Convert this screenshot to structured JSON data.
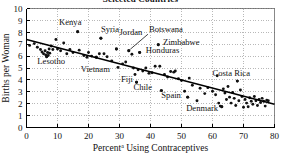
{
  "figure": {
    "title_partial": "Selected Countries",
    "title_clipped": true
  },
  "chart_data": {
    "type": "scatter",
    "title": "Selected Countries",
    "xlabel": "Percent Using Contraceptives",
    "xlabel_superscript": "a",
    "ylabel": "Births per Woman",
    "xlim": [
      0,
      80
    ],
    "ylim": [
      0,
      10
    ],
    "xticks": [
      0,
      10,
      20,
      30,
      40,
      50,
      60,
      70,
      80
    ],
    "yticks": [
      0,
      1,
      2,
      3,
      4,
      5,
      6,
      7,
      8,
      9,
      10
    ],
    "grid": true,
    "legend": "none",
    "trend_line": {
      "x0": 0,
      "y0": 7.4,
      "x1": 80,
      "y1": 1.95
    },
    "annotations": [
      {
        "label": "Kenya",
        "x": 16.5,
        "y": 8.05,
        "lx": 10.5,
        "ly": 8.6,
        "anchor": "start",
        "leader": false
      },
      {
        "label": "Syria",
        "x": 24.0,
        "y": 7.5,
        "lx": 24.0,
        "ly": 8.05,
        "anchor": "start",
        "leader": false
      },
      {
        "label": "Jordan",
        "x": 29.0,
        "y": 6.6,
        "lx": 30.0,
        "ly": 7.8,
        "anchor": "start",
        "leader": false
      },
      {
        "label": "Botswana",
        "x": 33.0,
        "y": 6.45,
        "lx": 39.5,
        "ly": 8.05,
        "anchor": "start",
        "leader": true
      },
      {
        "label": "Zimbabwe",
        "x": 42.5,
        "y": 6.95,
        "lx": 44.0,
        "ly": 6.95,
        "anchor": "start",
        "leader": false
      },
      {
        "label": "Honduras",
        "x": 36.5,
        "y": 6.3,
        "lx": 38.5,
        "ly": 6.25,
        "anchor": "start",
        "leader": false
      },
      {
        "label": "Lesotho",
        "x": 6.5,
        "y": 5.95,
        "lx": 3.5,
        "ly": 5.35,
        "anchor": "start",
        "leader": false
      },
      {
        "label": "Vietnam",
        "x": 22.5,
        "y": 5.9,
        "lx": 17.5,
        "ly": 4.7,
        "anchor": "start",
        "leader": false
      },
      {
        "label": "Fiji",
        "x": 35.5,
        "y": 3.8,
        "lx": 30.5,
        "ly": 3.8,
        "anchor": "start",
        "leader": false
      },
      {
        "label": "Chile",
        "x": 43.5,
        "y": 3.1,
        "lx": 34.5,
        "ly": 3.15,
        "anchor": "start",
        "leader": false
      },
      {
        "label": "Spain",
        "x": 52.0,
        "y": 2.55,
        "lx": 43.5,
        "ly": 2.5,
        "anchor": "start",
        "leader": false
      },
      {
        "label": "Denmark",
        "x": 63.0,
        "y": 1.75,
        "lx": 51.5,
        "ly": 1.35,
        "anchor": "start",
        "leader": false
      },
      {
        "label": "Costa Rica",
        "x": 68.0,
        "y": 3.9,
        "lx": 60.0,
        "ly": 4.3,
        "anchor": "start",
        "leader": false
      }
    ],
    "points": [
      {
        "x": 1.0,
        "y": 6.9
      },
      {
        "x": 2.5,
        "y": 7.05
      },
      {
        "x": 3.5,
        "y": 6.75
      },
      {
        "x": 4.5,
        "y": 6.55
      },
      {
        "x": 5.0,
        "y": 6.35
      },
      {
        "x": 5.5,
        "y": 6.2
      },
      {
        "x": 6.0,
        "y": 6.45
      },
      {
        "x": 6.2,
        "y": 6.1
      },
      {
        "x": 6.5,
        "y": 5.95
      },
      {
        "x": 6.8,
        "y": 6.3
      },
      {
        "x": 7.0,
        "y": 6.05
      },
      {
        "x": 7.3,
        "y": 6.6
      },
      {
        "x": 7.5,
        "y": 6.25
      },
      {
        "x": 8.0,
        "y": 6.85
      },
      {
        "x": 8.5,
        "y": 6.55
      },
      {
        "x": 9.5,
        "y": 7.4
      },
      {
        "x": 10.0,
        "y": 6.6
      },
      {
        "x": 11.0,
        "y": 6.45
      },
      {
        "x": 12.0,
        "y": 7.1
      },
      {
        "x": 13.0,
        "y": 6.2
      },
      {
        "x": 14.0,
        "y": 6.55
      },
      {
        "x": 15.0,
        "y": 6.3
      },
      {
        "x": 16.5,
        "y": 8.05
      },
      {
        "x": 17.0,
        "y": 6.5
      },
      {
        "x": 18.5,
        "y": 6.05
      },
      {
        "x": 19.5,
        "y": 5.9
      },
      {
        "x": 20.0,
        "y": 6.3
      },
      {
        "x": 21.0,
        "y": 6.0
      },
      {
        "x": 22.5,
        "y": 5.9
      },
      {
        "x": 23.5,
        "y": 6.2
      },
      {
        "x": 24.0,
        "y": 7.5
      },
      {
        "x": 25.0,
        "y": 6.2
      },
      {
        "x": 26.0,
        "y": 5.95
      },
      {
        "x": 27.5,
        "y": 5.6
      },
      {
        "x": 29.0,
        "y": 6.6
      },
      {
        "x": 29.5,
        "y": 5.05
      },
      {
        "x": 31.0,
        "y": 5.35
      },
      {
        "x": 32.0,
        "y": 5.5
      },
      {
        "x": 33.0,
        "y": 6.45
      },
      {
        "x": 34.0,
        "y": 6.15
      },
      {
        "x": 34.5,
        "y": 5.0
      },
      {
        "x": 35.0,
        "y": 4.45
      },
      {
        "x": 35.5,
        "y": 3.8
      },
      {
        "x": 36.0,
        "y": 4.85
      },
      {
        "x": 36.5,
        "y": 6.3
      },
      {
        "x": 37.5,
        "y": 4.75
      },
      {
        "x": 38.5,
        "y": 5.0
      },
      {
        "x": 39.5,
        "y": 4.55
      },
      {
        "x": 40.5,
        "y": 4.6
      },
      {
        "x": 41.5,
        "y": 5.15
      },
      {
        "x": 42.5,
        "y": 6.95
      },
      {
        "x": 43.0,
        "y": 5.15
      },
      {
        "x": 43.5,
        "y": 3.1
      },
      {
        "x": 44.5,
        "y": 4.45
      },
      {
        "x": 45.5,
        "y": 4.25
      },
      {
        "x": 46.5,
        "y": 4.7
      },
      {
        "x": 47.5,
        "y": 4.65
      },
      {
        "x": 48.0,
        "y": 4.75
      },
      {
        "x": 49.0,
        "y": 4.1
      },
      {
        "x": 50.0,
        "y": 3.95
      },
      {
        "x": 51.0,
        "y": 3.05
      },
      {
        "x": 52.0,
        "y": 2.55
      },
      {
        "x": 52.5,
        "y": 4.15
      },
      {
        "x": 53.5,
        "y": 3.55
      },
      {
        "x": 55.0,
        "y": 2.25
      },
      {
        "x": 56.0,
        "y": 3.3
      },
      {
        "x": 57.5,
        "y": 2.85
      },
      {
        "x": 58.5,
        "y": 3.35
      },
      {
        "x": 60.0,
        "y": 3.05
      },
      {
        "x": 61.0,
        "y": 2.75
      },
      {
        "x": 61.5,
        "y": 4.35
      },
      {
        "x": 62.0,
        "y": 2.05
      },
      {
        "x": 62.5,
        "y": 1.8
      },
      {
        "x": 63.0,
        "y": 1.75
      },
      {
        "x": 63.5,
        "y": 3.25
      },
      {
        "x": 64.0,
        "y": 2.9
      },
      {
        "x": 64.5,
        "y": 2.35
      },
      {
        "x": 65.0,
        "y": 3.45
      },
      {
        "x": 65.5,
        "y": 2.55
      },
      {
        "x": 66.0,
        "y": 2.05
      },
      {
        "x": 66.5,
        "y": 2.95
      },
      {
        "x": 67.0,
        "y": 2.45
      },
      {
        "x": 67.5,
        "y": 1.85
      },
      {
        "x": 68.0,
        "y": 3.9
      },
      {
        "x": 68.5,
        "y": 2.25
      },
      {
        "x": 69.0,
        "y": 3.15
      },
      {
        "x": 69.5,
        "y": 2.6
      },
      {
        "x": 70.0,
        "y": 1.7
      },
      {
        "x": 70.5,
        "y": 2.35
      },
      {
        "x": 71.0,
        "y": 2.05
      },
      {
        "x": 71.5,
        "y": 1.75
      },
      {
        "x": 72.0,
        "y": 2.5
      },
      {
        "x": 72.5,
        "y": 2.2
      },
      {
        "x": 73.0,
        "y": 1.95
      },
      {
        "x": 73.5,
        "y": 2.6
      },
      {
        "x": 74.0,
        "y": 2.25
      },
      {
        "x": 74.5,
        "y": 1.85
      },
      {
        "x": 75.0,
        "y": 2.35
      },
      {
        "x": 75.5,
        "y": 2.1
      },
      {
        "x": 76.0,
        "y": 2.45
      },
      {
        "x": 76.5,
        "y": 2.2
      },
      {
        "x": 77.0,
        "y": 1.8
      },
      {
        "x": 77.5,
        "y": 2.3
      },
      {
        "x": 78.0,
        "y": 2.25
      }
    ]
  }
}
